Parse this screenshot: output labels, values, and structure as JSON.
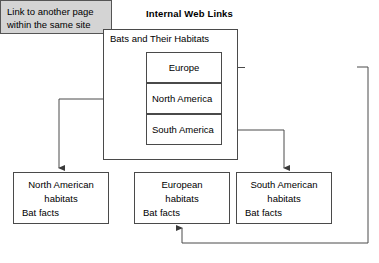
{
  "diagram": {
    "title": "Internal Web Links",
    "type": "flowchart"
  },
  "container": {
    "label": "Bats and Their Habitats"
  },
  "regions": [
    {
      "label": "Europe"
    },
    {
      "label": "North America"
    },
    {
      "label": "South America"
    }
  ],
  "callout": {
    "line1": "Link to another page",
    "line2": "within the same site",
    "fill_color": "#d4d4d4",
    "border_color": "#555555"
  },
  "leaf_pages": [
    {
      "head_line1": "North American",
      "head_line2": "habitats",
      "sub": "Bat facts"
    },
    {
      "head_line1": "European",
      "head_line2": "habitats",
      "sub": "Bat facts"
    },
    {
      "head_line1": "South American",
      "head_line2": "habitats",
      "sub": "Bat facts"
    }
  ],
  "colors": {
    "background": "#ffffff",
    "line": "#4a4a4a",
    "text": "#000000"
  }
}
